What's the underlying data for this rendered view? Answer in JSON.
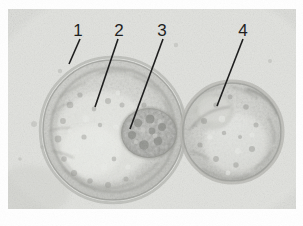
{
  "figure": {
    "caption": "",
    "background_color": "#ffffff",
    "plate_color": "#d9dad6",
    "annotation_color": "#1a1a1a"
  },
  "micrograph": {
    "kind": "light-microscopy-photomicrograph",
    "subject": "hatching blastocyst pair",
    "plate": {
      "x": 8,
      "y": 9,
      "width": 288,
      "height": 200
    },
    "structures": [
      {
        "name": "large-blastocyst",
        "shape": "circle",
        "cx": 105,
        "cy": 121,
        "r": 72,
        "fill": "#cfd0cb"
      },
      {
        "name": "small-blastocyst",
        "shape": "circle",
        "cx": 224,
        "cy": 123,
        "r": 51,
        "fill": "#cbccc7"
      },
      {
        "name": "inner-cell-mass",
        "shape": "blob",
        "cx": 141,
        "cy": 124,
        "r": 26,
        "fill": "#a6a7a2"
      }
    ]
  },
  "annotations": {
    "color": "#1a1a1a",
    "line_width": 1.6,
    "items": [
      {
        "id": "callout-1",
        "label": "1",
        "label_x": 78,
        "label_y": 22,
        "line": {
          "x1": 80,
          "y1": 39,
          "x2": 69,
          "y2": 64
        },
        "points_to": "zona-pellucida"
      },
      {
        "id": "callout-2",
        "label": "2",
        "label_x": 119,
        "label_y": 22,
        "line": {
          "x1": 118,
          "y1": 39,
          "x2": 95,
          "y2": 107
        },
        "points_to": "trophectoderm"
      },
      {
        "id": "callout-3",
        "label": "3",
        "label_x": 162,
        "label_y": 22,
        "line": {
          "x1": 163,
          "y1": 39,
          "x2": 130,
          "y2": 129
        },
        "points_to": "inner-cell-mass"
      },
      {
        "id": "callout-4",
        "label": "4",
        "label_x": 243,
        "label_y": 22,
        "line": {
          "x1": 243,
          "y1": 39,
          "x2": 217,
          "y2": 106
        },
        "points_to": "second-blastocyst"
      }
    ]
  }
}
